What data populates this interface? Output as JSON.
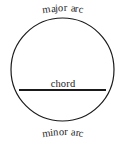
{
  "figure": {
    "background_color": "#ffffff",
    "stroke_color": "#1a1a1a",
    "text_color": "#1c1c1c",
    "labels": {
      "major_arc": "major arc",
      "chord": "chord",
      "minor_arc": "minor arc"
    },
    "geometry": {
      "circle": {
        "cx": 62.5,
        "cy": 69.5,
        "r": 51.5,
        "stroke_width": 1.2
      },
      "chord": {
        "x1": 19.0,
        "y1": 90.0,
        "x2": 106.0,
        "y2": 90.0,
        "stroke_width": 2.0
      }
    }
  }
}
